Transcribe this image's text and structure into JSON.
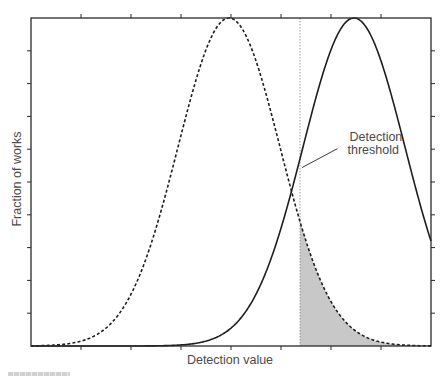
{
  "chart_data": {
    "type": "line",
    "title": "",
    "xlabel": "Detection value",
    "ylabel": "Fraction of works",
    "xlim": [
      0,
      8
    ],
    "ylim": [
      0,
      1
    ],
    "x_ticks": [
      1,
      2,
      3,
      4,
      5,
      6,
      7
    ],
    "y_ticks": [
      0.1,
      0.2,
      0.3,
      0.4,
      0.5,
      0.6,
      0.7,
      0.8,
      0.9
    ],
    "tick_labels_shown": false,
    "grid": false,
    "legend": null,
    "series": [
      {
        "name": "Unmarked works",
        "style": "dashed",
        "distribution": "normal",
        "mean": 3.96,
        "std": 1.02,
        "peak": 1.0
      },
      {
        "name": "Watermarked works",
        "style": "solid",
        "distribution": "normal",
        "mean": 6.46,
        "std": 1.02,
        "peak": 1.0
      }
    ],
    "threshold": {
      "x": 5.38,
      "style": "dotted",
      "label": "Detection threshold"
    },
    "shaded_region": {
      "description": "Area under dashed curve to the right of threshold (false positives)",
      "x_from": 5.38,
      "x_to": 8,
      "under_series": "dashed",
      "color": "#c8c8c8"
    },
    "annotations": [
      {
        "text_line1": "Detection",
        "text_line2": "threshold",
        "x": 6.25,
        "y": 0.55
      }
    ]
  },
  "colors": {
    "axis": "#2a2a2a",
    "curve": "#1e1e1e",
    "shade": "#c8c8c8",
    "text": "#4a4a4a",
    "threshold": "#9a9a9a"
  },
  "caption": {
    "visible_fragment": true
  }
}
